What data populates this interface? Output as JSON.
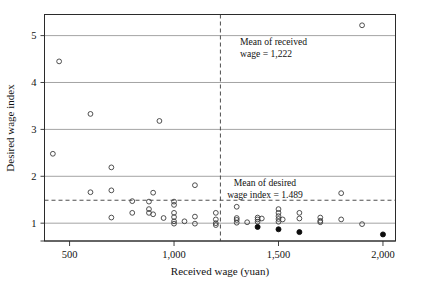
{
  "chart_data": {
    "type": "scatter",
    "title": "",
    "xlabel": "Received wage (yuan)",
    "ylabel": "Desired wage index",
    "xlim": [
      380,
      2060
    ],
    "ylim": [
      0.62,
      5.45
    ],
    "xticks": [
      500,
      1000,
      1500,
      2000
    ],
    "xticklabels": [
      "500",
      "1,000",
      "1,500",
      "2,000"
    ],
    "yticks": [
      1,
      2,
      3,
      4,
      5
    ],
    "yticklabels": [
      "1",
      "2",
      "3",
      "4",
      "5"
    ],
    "grid": "horizontal",
    "legend": "none",
    "series": [
      {
        "name": "open-markers",
        "marker": "open-circle",
        "points": [
          [
            420,
            2.48
          ],
          [
            450,
            4.45
          ],
          [
            600,
            3.33
          ],
          [
            600,
            1.66
          ],
          [
            700,
            2.19
          ],
          [
            700,
            1.7
          ],
          [
            700,
            1.12
          ],
          [
            800,
            1.47
          ],
          [
            800,
            1.22
          ],
          [
            880,
            1.46
          ],
          [
            880,
            1.3
          ],
          [
            880,
            1.22
          ],
          [
            900,
            1.65
          ],
          [
            900,
            1.19
          ],
          [
            930,
            3.18
          ],
          [
            950,
            1.11
          ],
          [
            1000,
            1.46
          ],
          [
            1000,
            1.39
          ],
          [
            1000,
            1.22
          ],
          [
            1000,
            1.13
          ],
          [
            1000,
            1.04
          ],
          [
            1000,
            0.99
          ],
          [
            1050,
            1.04
          ],
          [
            1100,
            1.81
          ],
          [
            1100,
            1.14
          ],
          [
            1100,
            0.99
          ],
          [
            1200,
            1.22
          ],
          [
            1200,
            1.08
          ],
          [
            1200,
            1.0
          ],
          [
            1200,
            0.96
          ],
          [
            1300,
            1.35
          ],
          [
            1300,
            1.11
          ],
          [
            1300,
            1.07
          ],
          [
            1300,
            1.01
          ],
          [
            1350,
            1.02
          ],
          [
            1400,
            1.12
          ],
          [
            1400,
            1.08
          ],
          [
            1400,
            1.03
          ],
          [
            1420,
            1.1
          ],
          [
            1500,
            1.3
          ],
          [
            1500,
            1.22
          ],
          [
            1500,
            1.15
          ],
          [
            1500,
            1.09
          ],
          [
            1500,
            1.03
          ],
          [
            1520,
            1.08
          ],
          [
            1600,
            1.22
          ],
          [
            1600,
            1.1
          ],
          [
            1700,
            1.12
          ],
          [
            1700,
            1.05
          ],
          [
            1700,
            1.02
          ],
          [
            1800,
            1.64
          ],
          [
            1800,
            1.08
          ],
          [
            1900,
            5.22
          ],
          [
            1900,
            0.98
          ]
        ]
      },
      {
        "name": "filled-markers",
        "marker": "filled-circle",
        "points": [
          [
            1400,
            0.92
          ],
          [
            1500,
            0.87
          ],
          [
            1600,
            0.81
          ],
          [
            2000,
            0.76
          ]
        ]
      }
    ],
    "reference_lines": [
      {
        "name": "mean-received-wage",
        "orientation": "vertical",
        "value": 1222,
        "style": "dashed",
        "label": [
          "Mean of received",
          "wage = 1,222"
        ]
      },
      {
        "name": "mean-desired-wage-index",
        "orientation": "horizontal",
        "value": 1.489,
        "style": "dashed",
        "label": [
          "Mean of desired",
          "wage index = 1.489"
        ]
      }
    ]
  },
  "annotations": {
    "received": {
      "line1": "Mean of received",
      "line2": "wage = 1,222"
    },
    "desired": {
      "line1": "Mean of desired",
      "line2": "wage index = 1.489"
    }
  },
  "axes": {
    "x_title": "Received wage (yuan)",
    "y_title": "Desired wage index",
    "x_tick_labels": [
      "500",
      "1,000",
      "1,500",
      "2,000"
    ],
    "y_tick_labels": [
      "1",
      "2",
      "3",
      "4",
      "5"
    ]
  },
  "colors": {
    "frame": "#2b2b2b",
    "grid": "#8d8d8d",
    "marker_open": "#3c3c3c",
    "marker_filled": "#0d0d0d",
    "dashed": "#3a3a3a",
    "text": "#121212",
    "background": "#ffffff"
  }
}
